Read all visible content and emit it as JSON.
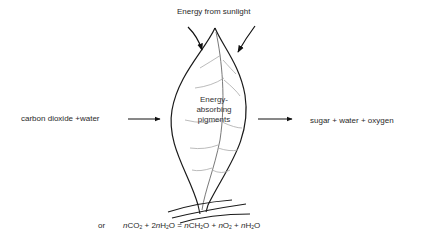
{
  "diagram": {
    "title_top": "Energy from sunlight",
    "input_label": "carbon dioxide +water",
    "output_label": "sugar + water + oxygen",
    "leaf_label_lines": [
      "Energy-",
      "absorbing",
      "pigments"
    ],
    "equation": {
      "prefix": "or",
      "n": "n",
      "co": "CO",
      "sub2": "2",
      "plus": "+",
      "two_n": "2",
      "h": "H",
      "o": "O",
      "equals": "=",
      "ch": "CH"
    }
  }
}
